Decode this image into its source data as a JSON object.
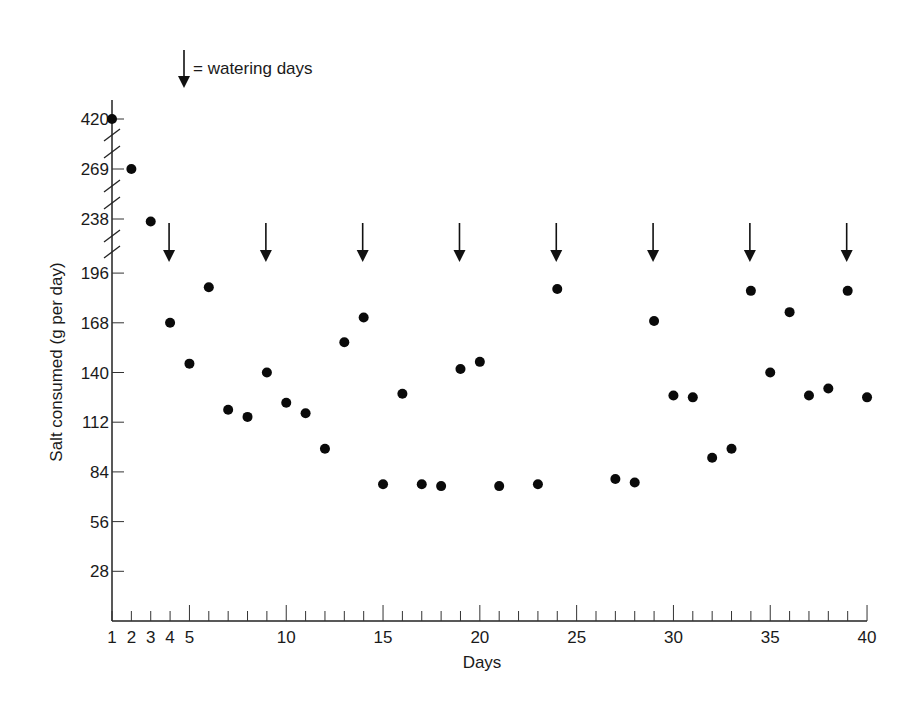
{
  "chart_data": {
    "type": "scatter",
    "title": "",
    "xlabel": "Days",
    "ylabel": "Salt consumed (g per day)",
    "x_ticks": [
      1,
      2,
      3,
      4,
      5,
      10,
      15,
      20,
      25,
      30,
      35,
      40
    ],
    "x_range": [
      1,
      40
    ],
    "y_ticks_linear": [
      28,
      56,
      84,
      112,
      140,
      168,
      196
    ],
    "y_ticks_broken": [
      238,
      269,
      420
    ],
    "y_axis_breaks": "axis broken between 196 and 238, 238 and 269, 269 and 420",
    "grid": false,
    "legend": {
      "symbol": "down-arrow",
      "label": "= watering days",
      "position": "top-left"
    },
    "watering_days": [
      4,
      9,
      14,
      19,
      24,
      29,
      34,
      39
    ],
    "points": [
      {
        "x": 1,
        "y": 420
      },
      {
        "x": 2,
        "y": 269
      },
      {
        "x": 3,
        "y": 236
      },
      {
        "x": 4,
        "y": 168
      },
      {
        "x": 5,
        "y": 145
      },
      {
        "x": 6,
        "y": 188
      },
      {
        "x": 7,
        "y": 119
      },
      {
        "x": 8,
        "y": 115
      },
      {
        "x": 9,
        "y": 140
      },
      {
        "x": 10,
        "y": 123
      },
      {
        "x": 11,
        "y": 117
      },
      {
        "x": 12,
        "y": 97
      },
      {
        "x": 13,
        "y": 157
      },
      {
        "x": 14,
        "y": 171
      },
      {
        "x": 15,
        "y": 77
      },
      {
        "x": 16,
        "y": 128
      },
      {
        "x": 17,
        "y": 77
      },
      {
        "x": 18,
        "y": 76
      },
      {
        "x": 19,
        "y": 142
      },
      {
        "x": 20,
        "y": 146
      },
      {
        "x": 21,
        "y": 76
      },
      {
        "x": 23,
        "y": 77
      },
      {
        "x": 24,
        "y": 187
      },
      {
        "x": 27,
        "y": 80
      },
      {
        "x": 28,
        "y": 78
      },
      {
        "x": 29,
        "y": 169
      },
      {
        "x": 30,
        "y": 127
      },
      {
        "x": 31,
        "y": 126
      },
      {
        "x": 32,
        "y": 92
      },
      {
        "x": 33,
        "y": 97
      },
      {
        "x": 34,
        "y": 186
      },
      {
        "x": 35,
        "y": 140
      },
      {
        "x": 36,
        "y": 174
      },
      {
        "x": 37,
        "y": 127
      },
      {
        "x": 38,
        "y": 131
      },
      {
        "x": 39,
        "y": 186
      },
      {
        "x": 40,
        "y": 126
      }
    ]
  }
}
